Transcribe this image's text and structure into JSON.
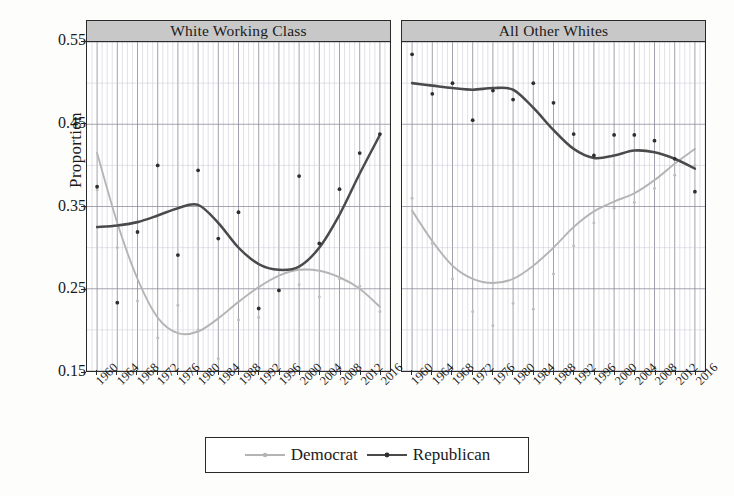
{
  "axes": {
    "ylabel": "Proportion",
    "yticks": [
      "0.55",
      "0.45",
      "0.35",
      "0.25",
      "0.15"
    ],
    "xticks": [
      "1960",
      "1964",
      "1968",
      "1972",
      "1976",
      "1980",
      "1984",
      "1988",
      "1992",
      "1996",
      "2000",
      "2004",
      "2008",
      "2012",
      "2016"
    ]
  },
  "legend": {
    "democrat_label": "Democrat",
    "republican_label": "Republican",
    "democrat_color": "#b4b4b4",
    "republican_color": "#4a4a4a"
  },
  "panels": [
    {
      "title": "White Working Class"
    },
    {
      "title": "All Other Whites"
    }
  ],
  "chart_data": {
    "type": "line",
    "title": "",
    "xlabel": "",
    "ylabel": "Proportion",
    "ylim": [
      0.15,
      0.55
    ],
    "xlim": [
      1958,
      2018
    ],
    "grid": true,
    "legend_position": "bottom",
    "facets": [
      "White Working Class",
      "All Other Whites"
    ],
    "x": [
      1960,
      1964,
      1968,
      1972,
      1976,
      1980,
      1984,
      1988,
      1992,
      1996,
      2000,
      2004,
      2008,
      2012,
      2016
    ],
    "panels": [
      {
        "facet": "White Working Class",
        "series": [
          {
            "name": "Democrat",
            "color": "#b4b4b4",
            "points": [
              0.37,
              0.3,
              0.235,
              0.19,
              0.23,
              0.2,
              0.165,
              0.212,
              0.215,
              0.248,
              0.255,
              0.24,
              0.262,
              0.253,
              0.222
            ],
            "smooth": [
              0.415,
              0.33,
              0.262,
              0.215,
              0.196,
              0.198,
              0.214,
              0.234,
              0.252,
              0.266,
              0.273,
              0.272,
              0.264,
              0.25,
              0.228
            ]
          },
          {
            "name": "Republican",
            "color": "#4a4a4a",
            "points": [
              0.374,
              0.233,
              0.319,
              0.4,
              0.291,
              0.394,
              0.311,
              0.343,
              0.226,
              0.248,
              0.387,
              0.305,
              0.371,
              0.415,
              0.438
            ],
            "smooth": [
              0.325,
              0.327,
              0.331,
              0.339,
              0.348,
              0.352,
              0.33,
              0.3,
              0.28,
              0.273,
              0.277,
              0.3,
              0.34,
              0.39,
              0.437
            ]
          }
        ]
      },
      {
        "facet": "All Other Whites",
        "series": [
          {
            "name": "Democrat",
            "color": "#b4b4b4",
            "points": [
              0.36,
              0.305,
              0.262,
              0.222,
              0.205,
              0.232,
              0.225,
              0.268,
              0.302,
              0.33,
              0.348,
              0.355,
              0.372,
              0.388,
              0.4
            ],
            "smooth": [
              0.345,
              0.308,
              0.278,
              0.262,
              0.257,
              0.262,
              0.278,
              0.3,
              0.325,
              0.344,
              0.356,
              0.366,
              0.382,
              0.402,
              0.42
            ]
          },
          {
            "name": "Republican",
            "color": "#4a4a4a",
            "points": [
              0.535,
              0.487,
              0.5,
              0.455,
              0.491,
              0.48,
              0.5,
              0.476,
              0.438,
              0.412,
              0.437,
              0.437,
              0.43,
              0.408,
              0.368
            ],
            "smooth": [
              0.5,
              0.497,
              0.494,
              0.492,
              0.494,
              0.492,
              0.47,
              0.443,
              0.42,
              0.409,
              0.412,
              0.418,
              0.416,
              0.408,
              0.396
            ]
          }
        ]
      }
    ]
  }
}
